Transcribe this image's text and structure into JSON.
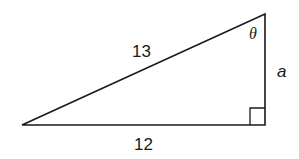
{
  "diagram": {
    "type": "right-triangle",
    "labels": {
      "hypotenuse": "13",
      "base": "12",
      "vertical_side": "a",
      "angle": "θ"
    },
    "colors": {
      "stroke": "#1a1a1a",
      "background": "#ffffff"
    }
  }
}
